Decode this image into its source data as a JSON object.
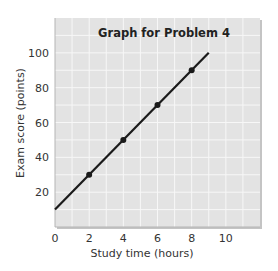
{
  "chart_data": {
    "type": "line",
    "title": "Graph for Problem 4",
    "xlabel": "Study time (hours)",
    "ylabel": "Exam score (points)",
    "xlim": [
      0,
      12
    ],
    "ylim": [
      0,
      120
    ],
    "x_ticks": [
      0,
      2,
      4,
      6,
      8,
      10
    ],
    "y_ticks": [
      20,
      40,
      60,
      80,
      100
    ],
    "grid": true,
    "grid_x_step": 1,
    "grid_y_step": 10,
    "legend": null,
    "series": [
      {
        "name": "Exam score vs study time",
        "line": {
          "x": [
            0,
            9
          ],
          "y": [
            10,
            100
          ]
        },
        "points": {
          "x": [
            2,
            4,
            6,
            8
          ],
          "y": [
            30,
            50,
            70,
            90
          ]
        }
      }
    ],
    "colors": {
      "plot_background": "#e3e3e3",
      "grid": "#f7f7f7",
      "line": "#1a1a1a",
      "border": "#b5b5b5"
    }
  }
}
